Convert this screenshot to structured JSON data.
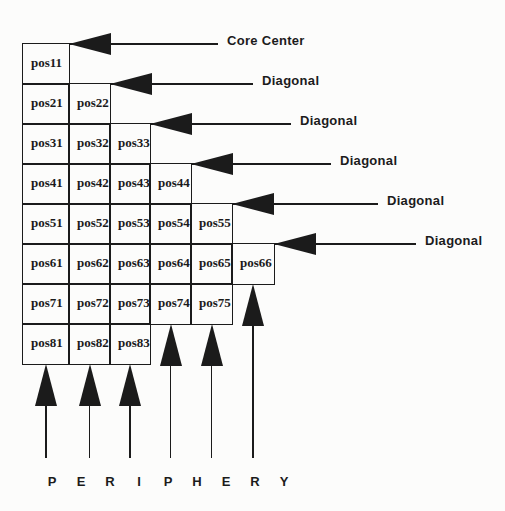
{
  "figure": {
    "background": "#fcfcfb",
    "ink": "#1b1b1b"
  },
  "grid": {
    "rows": [
      [
        "pos11"
      ],
      [
        "pos21",
        "pos22"
      ],
      [
        "pos31",
        "pos32",
        "pos33"
      ],
      [
        "pos41",
        "pos42",
        "pos43",
        "pos44"
      ],
      [
        "pos51",
        "pos52",
        "pos53",
        "pos54",
        "pos55"
      ],
      [
        "pos61",
        "pos62",
        "pos63",
        "pos64",
        "pos65",
        "pos66"
      ],
      [
        "pos71",
        "pos72",
        "pos73",
        "pos74",
        "pos75"
      ],
      [
        "pos81",
        "pos82",
        "pos83"
      ]
    ]
  },
  "callouts": [
    {
      "label": "Core Center"
    },
    {
      "label": "Diagonal"
    },
    {
      "label": "Diagonal"
    },
    {
      "label": "Diagonal"
    },
    {
      "label": "Diagonal"
    },
    {
      "label": "Diagonal"
    }
  ],
  "periphery": {
    "letters": [
      "P",
      "E",
      "R",
      "I",
      "P",
      "H",
      "E",
      "R",
      "Y"
    ]
  }
}
